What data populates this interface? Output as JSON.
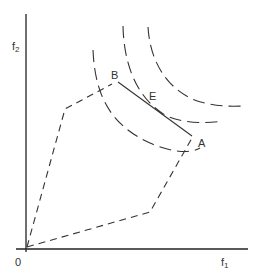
{
  "diagram": {
    "type": "multi-objective optimization feasible region with indifference curves",
    "axes": {
      "x_label": "f",
      "x_sub": "1",
      "y_label": "f",
      "y_sub": "2",
      "origin_label": "0"
    },
    "points": {
      "A": "A",
      "B": "B",
      "E": "E"
    },
    "colors": {
      "stroke": "#333333",
      "axis": "#222222",
      "background": "#ffffff"
    },
    "elements": [
      "feasible region (dashed polygon)",
      "Pareto frontier segment B–A (solid)",
      "three dashed indifference curves",
      "tangency point E"
    ]
  }
}
